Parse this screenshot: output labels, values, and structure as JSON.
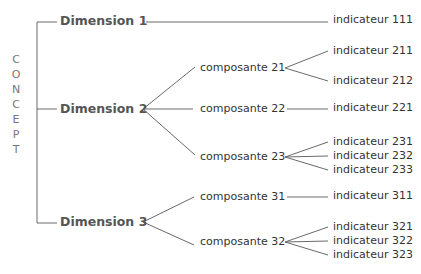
{
  "root": {
    "label_letters": [
      "C",
      "O",
      "N",
      "C",
      "E",
      "P",
      "T"
    ],
    "label": "CONCEPT"
  },
  "dimensions": [
    {
      "label": "Dimension 1",
      "indicators_direct": [
        {
          "label": "indicateur 111"
        }
      ]
    },
    {
      "label": "Dimension 2",
      "components": [
        {
          "label": "composante 21",
          "indicators": [
            {
              "label": "indicateur 211"
            },
            {
              "label": "indicateur 212"
            }
          ]
        },
        {
          "label": "composante 22",
          "indicators": [
            {
              "label": "indicateur 221"
            }
          ]
        },
        {
          "label": "composante 23",
          "indicators": [
            {
              "label": "indicateur 231"
            },
            {
              "label": "indicateur 232"
            },
            {
              "label": "indicateur 233"
            }
          ]
        }
      ]
    },
    {
      "label": "Dimension 3",
      "components": [
        {
          "label": "composante 31",
          "indicators": [
            {
              "label": "indicateur 311"
            }
          ]
        },
        {
          "label": "composante 32",
          "indicators": [
            {
              "label": "indicateur 321"
            },
            {
              "label": "indicateur 322"
            },
            {
              "label": "indicateur 323"
            }
          ]
        }
      ]
    }
  ],
  "colors": {
    "line": "#6a6a6a",
    "dimension_text": "#555555",
    "text": "#333333",
    "concept_text": "#777777"
  }
}
